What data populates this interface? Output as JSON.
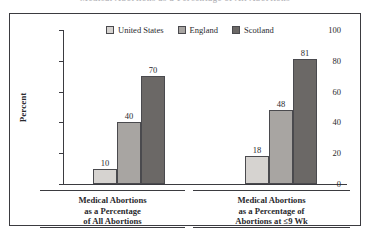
{
  "figure": {
    "title_clipped": "Medical Abortions as a Percentage of All Abortions"
  },
  "legend": {
    "items": [
      {
        "label": "United States",
        "color": "#d6d3d0"
      },
      {
        "label": "England",
        "color": "#a8a5a2"
      },
      {
        "label": "Scotland",
        "color": "#6b6866"
      }
    ]
  },
  "axes": {
    "ylabel": "Percent",
    "yticks": [
      "0",
      "20",
      "40",
      "60",
      "80",
      "100"
    ]
  },
  "chart_data": {
    "type": "bar",
    "title": "Medical Abortions as a Percentage of All Abortions",
    "xlabel": "",
    "ylabel": "Percent",
    "ylim": [
      0,
      100
    ],
    "yticks": [
      0,
      20,
      40,
      60,
      80,
      100
    ],
    "grid": false,
    "legend_position": "top-center",
    "categories": [
      "Medical Abortions as a Percentage of All Abortions",
      "Medical Abortions as a Percentage of Abortions at ≤9 Wk"
    ],
    "category_lines": [
      [
        "Medical Abortions",
        "as a Percentage",
        "of All Abortions"
      ],
      [
        "Medical Abortions",
        "as a Percentage of",
        "Abortions at ≤9 Wk"
      ]
    ],
    "series": [
      {
        "name": "United States",
        "color": "#d6d3d0",
        "values": [
          10,
          18
        ]
      },
      {
        "name": "England",
        "color": "#a8a5a2",
        "values": [
          40,
          48
        ]
      },
      {
        "name": "Scotland",
        "color": "#6b6866",
        "values": [
          70,
          81
        ]
      }
    ],
    "data_labels": [
      [
        "10",
        "40",
        "70"
      ],
      [
        "18",
        "48",
        "81"
      ]
    ]
  }
}
